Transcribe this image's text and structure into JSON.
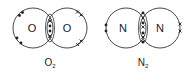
{
  "diagrams": [
    {
      "id": "o2",
      "molecule_label": "O",
      "molecule_subscript": "2",
      "atoms": [
        {
          "symbol": "O",
          "electron_marker": "dot"
        },
        {
          "symbol": "O",
          "electron_marker": "cross"
        }
      ],
      "shared_electrons": [
        "cross",
        "dot",
        "dot",
        "cross"
      ],
      "lone_pairs_left": [
        "dot-pair-top-left",
        "dot-pair-bottom-left"
      ],
      "lone_pairs_right": [
        "cross-pair-top-right",
        "cross-pair-bottom-right"
      ]
    },
    {
      "id": "n2",
      "molecule_label": "N",
      "molecule_subscript": "2",
      "atoms": [
        {
          "symbol": "N",
          "electron_marker": "dot"
        },
        {
          "symbol": "N",
          "electron_marker": "cross"
        }
      ],
      "shared_electrons": [
        "dot",
        "cross",
        "dot",
        "cross",
        "dot",
        "cross"
      ],
      "lone_pairs_left": [
        "dot-pair-left"
      ],
      "lone_pairs_right": [
        "cross-pair-right"
      ]
    }
  ]
}
